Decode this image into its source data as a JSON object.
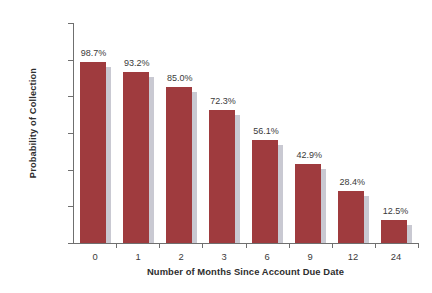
{
  "chart_data": {
    "type": "bar",
    "title": "",
    "xlabel": "Number of Months Since Account Due Date",
    "ylabel": "Probability of Collection",
    "categories": [
      "0",
      "1",
      "2",
      "3",
      "6",
      "9",
      "12",
      "24"
    ],
    "values": [
      98.7,
      93.2,
      85.0,
      72.3,
      56.1,
      42.9,
      28.4,
      12.5
    ],
    "data_labels": [
      "98.7%",
      "93.2%",
      "85.0%",
      "72.3%",
      "56.1%",
      "42.9%",
      "28.4%",
      "12.5%"
    ],
    "ylim": [
      0,
      120
    ],
    "ytick_values": [
      0,
      20,
      40,
      60,
      80,
      100,
      120
    ],
    "ytick_labels": [
      "0.0%",
      "20.0%",
      "40.0%",
      "60.0%",
      "80.0%",
      "100.0%",
      "120.0%"
    ],
    "grid": false,
    "legend": false,
    "legend_position": "none",
    "series": [
      {
        "name": "Probability of Collection",
        "values": [
          98.7,
          93.2,
          85.0,
          72.3,
          56.1,
          42.9,
          28.4,
          12.5
        ]
      }
    ],
    "colors": {
      "bar": "#9f3b3e",
      "bar_shadow": "#c9c9d2",
      "axis": "#6f6f6f",
      "text": "#3a3a3a",
      "background": "#ffffff"
    }
  }
}
